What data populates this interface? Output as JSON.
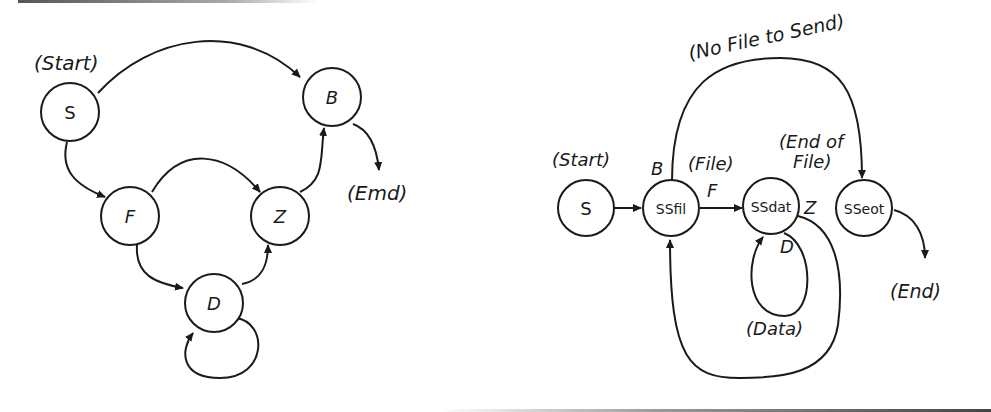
{
  "left_diagram": {
    "nodes": {
      "S": "S",
      "B": "B",
      "F": "F",
      "Z": "Z",
      "D": "D"
    },
    "annotations": {
      "start": "(Start)",
      "end": "(Emd)"
    },
    "edges": [
      {
        "from": "S",
        "to": "B"
      },
      {
        "from": "S",
        "to": "F"
      },
      {
        "from": "F",
        "to": "Z"
      },
      {
        "from": "F",
        "to": "D"
      },
      {
        "from": "D",
        "to": "Z"
      },
      {
        "from": "D",
        "to": "D"
      },
      {
        "from": "Z",
        "to": "B"
      },
      {
        "from": "B",
        "to": "End"
      }
    ]
  },
  "right_diagram": {
    "nodes": {
      "S": "S",
      "SSfil": "SSfil",
      "SSdat": "SSdat",
      "SSeot": "SSeot"
    },
    "annotations": {
      "start": "(Start)",
      "no_file": "(No File to Send)",
      "file": "(File)",
      "end_of_file_1": "(End of",
      "end_of_file_2": "File)",
      "data": "(Data)",
      "end": "(End)"
    },
    "edge_labels": {
      "B": "B",
      "F": "F",
      "Z": "Z",
      "D": "D"
    },
    "edges": [
      {
        "from": "S",
        "to": "SSfil"
      },
      {
        "from": "SSfil",
        "to": "SSdat",
        "label": "F"
      },
      {
        "from": "SSfil",
        "to": "SSeot",
        "label": "B"
      },
      {
        "from": "SSdat",
        "to": "SSdat",
        "label": "D"
      },
      {
        "from": "SSdat",
        "to": "SSfil",
        "label": "Z"
      },
      {
        "from": "SSeot",
        "to": "End"
      }
    ]
  }
}
